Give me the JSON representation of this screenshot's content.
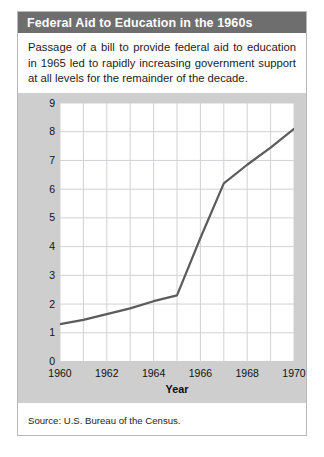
{
  "figure": {
    "title": "Federal Aid to Education in the 1960s",
    "caption": "Passage of a bill to provide federal aid to education in 1965 led to rapidly increasing government support at all levels for the remainder of the decade.",
    "source": "Source: U.S. Bureau of the Census."
  },
  "colors": {
    "title_bar": "#6e6e6e",
    "title_text": "#ffffff",
    "panel_background": "#cecece",
    "plot_background": "#ffffff",
    "gridline": "#d2d2d6",
    "series_line": "#5b5b5b",
    "border": "#b9b9b9"
  },
  "chart_data": {
    "type": "line",
    "title": "Federal Aid to Education in the 1960s",
    "xlabel": "Year",
    "ylabel": "Billions of dollars",
    "xlim": [
      1960,
      1970
    ],
    "ylim": [
      0,
      9
    ],
    "grid": true,
    "legend": "none",
    "xticks": [
      1960,
      1962,
      1964,
      1966,
      1968,
      1970
    ],
    "xtick_labels": [
      "1960",
      "1962",
      "1964",
      "1966",
      "1968",
      "1970"
    ],
    "yticks": [
      0,
      1,
      2,
      3,
      4,
      5,
      6,
      7,
      8,
      9
    ],
    "ytick_labels": [
      "0",
      "1",
      "2",
      "3",
      "4",
      "5",
      "6",
      "7",
      "8",
      "9"
    ],
    "x_minor_step": 1,
    "y_minor_step": 1,
    "series": [
      {
        "name": "Federal aid to education",
        "x": [
          1960,
          1961,
          1962,
          1963,
          1964,
          1965,
          1966,
          1967,
          1968,
          1969,
          1970
        ],
        "values": [
          1.3,
          1.45,
          1.65,
          1.85,
          2.1,
          2.3,
          4.3,
          6.2,
          6.85,
          7.45,
          8.1
        ]
      }
    ]
  }
}
